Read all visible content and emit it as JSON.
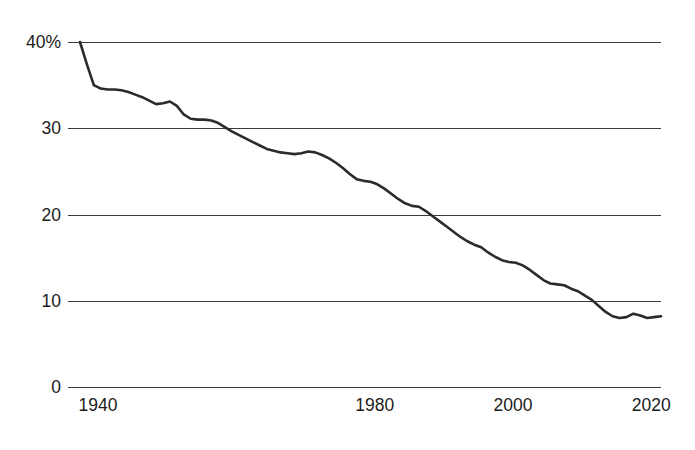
{
  "chart_data": {
    "type": "line",
    "title": "",
    "subtitle": "",
    "xlabel": "",
    "ylabel": "",
    "xlim": [
      1940,
      2024
    ],
    "ylim": [
      0,
      40
    ],
    "grid": true,
    "legend": false,
    "legend_position": "none",
    "line_color": "#2b2b2b",
    "grid_color": "#3a3a3a",
    "background_color": "#ffffff",
    "y_ticks": [
      0,
      10,
      20,
      30,
      40
    ],
    "y_tick_labels": [
      "0",
      "10",
      "20",
      "30",
      "40%"
    ],
    "x_ticks": [
      1940,
      1980,
      2000,
      2020
    ],
    "x_tick_labels": [
      "1940",
      "1980",
      "2000",
      "2020"
    ],
    "series": [
      {
        "name": "share",
        "x": [
          1940,
          1941,
          1942,
          1943,
          1944,
          1945,
          1946,
          1947,
          1948,
          1949,
          1950,
          1951,
          1952,
          1953,
          1954,
          1955,
          1956,
          1957,
          1958,
          1959,
          1960,
          1961,
          1962,
          1963,
          1964,
          1965,
          1966,
          1967,
          1968,
          1969,
          1970,
          1971,
          1972,
          1973,
          1974,
          1975,
          1976,
          1977,
          1978,
          1979,
          1980,
          1981,
          1982,
          1983,
          1984,
          1985,
          1986,
          1987,
          1988,
          1989,
          1990,
          1991,
          1992,
          1993,
          1994,
          1995,
          1996,
          1997,
          1998,
          1999,
          2000,
          2001,
          2002,
          2003,
          2004,
          2005,
          2006,
          2007,
          2008,
          2009,
          2010,
          2011,
          2012,
          2013,
          2014,
          2015,
          2016,
          2017,
          2018,
          2019,
          2020,
          2021,
          2022,
          2023,
          2024
        ],
        "values": [
          40.0,
          37.4,
          35.0,
          34.6,
          34.5,
          34.5,
          34.4,
          34.2,
          33.9,
          33.6,
          33.2,
          32.8,
          32.9,
          33.1,
          32.6,
          31.6,
          31.1,
          31.0,
          31.0,
          30.9,
          30.6,
          30.1,
          29.6,
          29.2,
          28.8,
          28.4,
          28.0,
          27.6,
          27.4,
          27.2,
          27.1,
          27.0,
          27.1,
          27.3,
          27.2,
          26.9,
          26.5,
          26.0,
          25.4,
          24.7,
          24.1,
          23.9,
          23.8,
          23.5,
          23.0,
          22.4,
          21.8,
          21.3,
          21.0,
          20.9,
          20.4,
          19.8,
          19.2,
          18.6,
          18.0,
          17.4,
          16.9,
          16.5,
          16.2,
          15.6,
          15.1,
          14.7,
          14.5,
          14.4,
          14.1,
          13.6,
          13.0,
          12.4,
          12.0,
          11.9,
          11.8,
          11.4,
          11.1,
          10.6,
          10.1,
          9.4,
          8.7,
          8.2,
          8.0,
          8.1,
          8.5,
          8.3,
          8.0,
          8.1,
          8.2
        ]
      }
    ]
  },
  "axis": {
    "y_tick_0": "0",
    "y_tick_10": "10",
    "y_tick_20": "20",
    "y_tick_30": "30",
    "y_tick_40": "40%",
    "x_tick_1940": "1940",
    "x_tick_1980": "1980",
    "x_tick_2000": "2000",
    "x_tick_2020": "2020"
  }
}
